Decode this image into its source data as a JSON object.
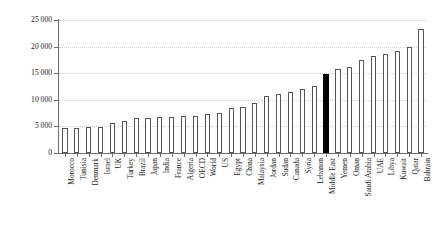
{
  "chart_data": {
    "type": "bar",
    "title": "",
    "subtitle": "",
    "xlabel": "",
    "ylabel": "",
    "ylim": [
      0,
      25000
    ],
    "grid": true,
    "legend": "none",
    "y_ticks": [
      0,
      5000,
      10000,
      15000,
      20000,
      25000
    ],
    "y_tick_labels": [
      "0",
      "5 000",
      "10 000",
      "15 000",
      "20 000",
      "25 000"
    ],
    "highlight_category": "Middle East",
    "highlight_color": "#000000",
    "bar_fill_color": "#ffffff",
    "bar_border_color": "#555555",
    "gridline_color": "#d2d2d2",
    "axis_color": "#6e6e6e",
    "categories": [
      "Morocco",
      "Tunisia",
      "Denmark",
      "Israel",
      "UK",
      "Turkey",
      "Brazil",
      "Japan",
      "India",
      "France",
      "Algeria",
      "OECD",
      "World",
      "US",
      "Egypt",
      "China",
      "Malaysia",
      "Jordan",
      "Sudan",
      "Canada",
      "Syria",
      "Lebanon",
      "Middle East",
      "Yemen",
      "Oman",
      "Saudi Arabia",
      "UAE",
      "Libya",
      "Kuwait",
      "Qatar",
      "Bahrain"
    ],
    "values": [
      4700,
      4700,
      4800,
      4900,
      5600,
      6100,
      6500,
      6600,
      6700,
      6800,
      6900,
      7000,
      7300,
      7600,
      8400,
      8700,
      9400,
      10700,
      11000,
      11400,
      12000,
      12600,
      14900,
      15700,
      16200,
      17500,
      18200,
      18700,
      19100,
      20000,
      23400
    ]
  }
}
